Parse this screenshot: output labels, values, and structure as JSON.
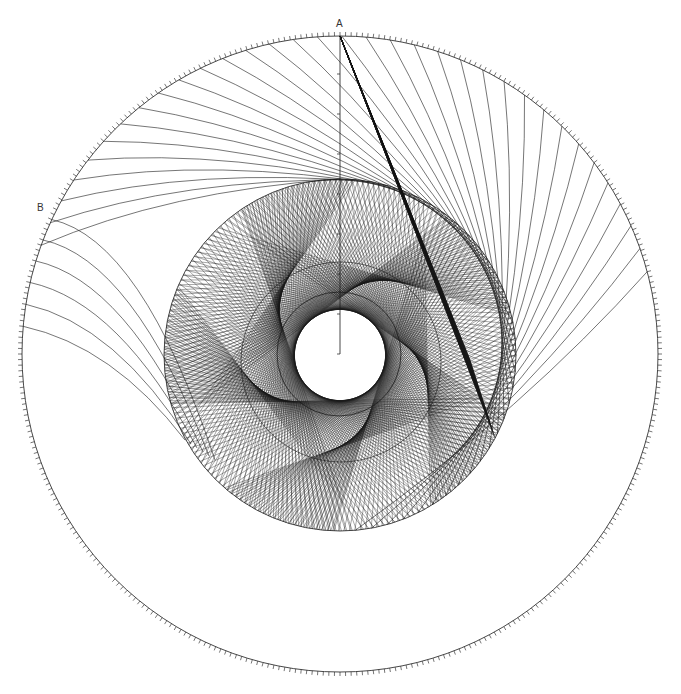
{
  "diagram": {
    "title": "",
    "canvas": {
      "width": 681,
      "height": 694,
      "background": "#ffffff"
    },
    "stroke_color": "#1a1a1a",
    "labels": [
      {
        "id": "A",
        "text": "A",
        "x": 336,
        "y": 19
      },
      {
        "id": "B",
        "text": "B",
        "x": 37,
        "y": 203
      }
    ],
    "outer_circle": {
      "cx": 340,
      "cy": 354,
      "r": 318,
      "tick_count": 360,
      "tick_length": 4,
      "stroke_width": 0.8
    },
    "middle_circle": {
      "cx": 340,
      "cy": 355,
      "r": 176,
      "stroke_width": 0.8
    },
    "inner_circle": {
      "cx": 339,
      "cy": 354,
      "r": 62,
      "stroke_width": 0.8
    },
    "envelope_circle": {
      "cx": 341,
      "cy": 362,
      "r": 100,
      "stroke_width": 0.6
    },
    "vertical_axis": {
      "x": 340,
      "y_top": 36,
      "y_bottom": 354,
      "tick_spacing": 40,
      "tick_length": 3
    },
    "rosette": {
      "description": "string-art chords of the middle circle forming a rotated polygonal rosette",
      "lobes": 5,
      "chords_per_lobe": 40,
      "chord_span_deg": 150,
      "rotation_deg": -18,
      "stroke_width": 0.45,
      "opacity": 0.85
    },
    "fan_curves": {
      "description": "curved lines from upper outer arc (between B and right of A) sweeping toward the middle circle",
      "count": 34,
      "start_angle_deg": 200,
      "end_angle_deg": 345,
      "stroke_width": 0.6
    },
    "wedge": {
      "description": "dense dark wedge of lines from point A toward lower right of middle circle",
      "apex": [
        340,
        36
      ],
      "base_start": [
        470,
        360
      ],
      "base_end": [
        495,
        438
      ],
      "line_count": 60
    },
    "lower_left_curves": {
      "description": "long curves leaving the left side of the outer circle toward the middle circle",
      "count": 6
    }
  }
}
